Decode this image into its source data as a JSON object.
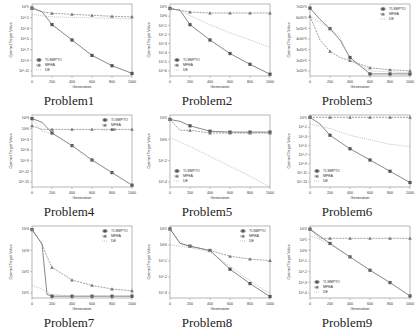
{
  "figure": {
    "series_names": [
      "TLSMPTO",
      "MFEA",
      "DE"
    ],
    "colors": {
      "TLSMPTO": "#555555",
      "MFEA": "#777777",
      "DE": "#aaaaaa",
      "axis": "#888888",
      "text": "#333333"
    },
    "xlabel": "Generation",
    "ylabel": "Optimal Target Value"
  },
  "chart_data": [
    {
      "type": "line",
      "title": "Problem1",
      "yscale": "log",
      "xlabel": "Generation",
      "ylabel": "Optimal Target Value",
      "x_ticks": [
        0,
        200,
        400,
        600,
        800,
        1000
      ],
      "y_ticks": [
        "10^1",
        "10^-1",
        "10^-3",
        "10^-5",
        "10^-7",
        "10^-9",
        "10^-11"
      ],
      "ylim_exp": [
        -12,
        2
      ],
      "legend_position": "lower left",
      "x": [
        0,
        100,
        200,
        400,
        600,
        800,
        1000
      ],
      "series": [
        {
          "name": "TLSMPTO",
          "values_exp": [
            1.2,
            0.5,
            -2,
            -5,
            -8,
            -10,
            -11.5
          ]
        },
        {
          "name": "MFEA",
          "values_exp": [
            1.2,
            0.5,
            0.2,
            0,
            -0.2,
            -0.4,
            -0.5
          ]
        },
        {
          "name": "DE",
          "values_exp": [
            0,
            -0.3,
            -0.5,
            -0.6,
            -0.7,
            -0.8,
            -0.9
          ]
        }
      ]
    },
    {
      "type": "line",
      "title": "Problem2",
      "yscale": "log",
      "xlabel": "Generation",
      "ylabel": "Optimal Target Value",
      "x_ticks": [
        0,
        200,
        400,
        600,
        800,
        1000
      ],
      "y_ticks": [
        "10^1",
        "10^0",
        "10^-1",
        "10^-2",
        "10^-3",
        "10^-4",
        "10^-5",
        "10^-6"
      ],
      "ylim_exp": [
        -6.5,
        1.5
      ],
      "legend_position": "lower left",
      "x": [
        0,
        100,
        200,
        400,
        600,
        800,
        1000
      ],
      "series": [
        {
          "name": "TLSMPTO",
          "values_exp": [
            1,
            0.8,
            -0.8,
            -2.5,
            -4,
            -5.2,
            -6.3
          ]
        },
        {
          "name": "MFEA",
          "values_exp": [
            1,
            0.8,
            0.6,
            0.5,
            0.5,
            0.5,
            0.5
          ]
        },
        {
          "name": "DE",
          "values_exp": [
            1,
            0.8,
            0.2,
            -0.8,
            -1.7,
            -2.5,
            -3.3
          ]
        }
      ]
    },
    {
      "type": "line",
      "title": "Problem3",
      "yscale": "log",
      "xlabel": "Generation",
      "ylabel": "Optimal Target Value",
      "x_ticks": [
        0,
        200,
        400,
        600,
        800,
        1000
      ],
      "y_ticks": [
        "7x10^1",
        "6x10^1",
        "5x10^1",
        "4x10^1",
        "3x10^1",
        "2x10^1",
        "1x10^1"
      ],
      "ylim_exp": [
        0,
        7
      ],
      "legend_position": "upper right",
      "x": [
        0,
        100,
        200,
        300,
        400,
        600,
        800,
        1000
      ],
      "series": [
        {
          "name": "TLSMPTO",
          "values_exp": [
            6.6,
            5.5,
            4.6,
            3.5,
            1.8,
            0.2,
            0.2,
            0.2
          ]
        },
        {
          "name": "MFEA",
          "values_exp": [
            5.8,
            3.5,
            2.4,
            1.8,
            1.5,
            0.8,
            0.6,
            0.5
          ]
        },
        {
          "name": "DE",
          "values_exp": [
            5.8,
            5.2,
            4.6,
            3.8,
            1.5,
            0.5,
            0.4,
            0.3
          ]
        }
      ]
    },
    {
      "type": "line",
      "title": "Problem4",
      "yscale": "log",
      "xlabel": "Generation",
      "ylabel": "Optimal Target Value",
      "x_ticks": [
        0,
        200,
        400,
        600,
        800,
        1000
      ],
      "y_ticks": [
        "10^3",
        "10^0",
        "10^-3",
        "10^-6",
        "10^-9",
        "10^-12",
        "10^-15"
      ],
      "ylim_exp": [
        -16,
        4
      ],
      "legend_position": "upper right",
      "x": [
        0,
        100,
        200,
        400,
        600,
        800,
        1000
      ],
      "series": [
        {
          "name": "TLSMPTO",
          "values_exp": [
            3,
            2,
            -1,
            -4.5,
            -8.5,
            -12,
            -15.5
          ]
        },
        {
          "name": "MFEA",
          "values_exp": [
            1,
            0,
            0,
            0,
            0,
            0,
            0
          ]
        },
        {
          "name": "DE",
          "values_exp": [
            3,
            -0.5,
            -1.2,
            -4.5,
            -8.5,
            -12,
            -15.5
          ]
        }
      ]
    },
    {
      "type": "line",
      "title": "Problem5",
      "yscale": "log",
      "xlabel": "Generation",
      "ylabel": "Optimal Target Value",
      "x_ticks": [
        0,
        200,
        400,
        600,
        800,
        1000
      ],
      "y_ticks": [
        "10^2",
        "10^0",
        "10^-2",
        "10^-4"
      ],
      "ylim_exp": [
        -5,
        3
      ],
      "legend_position": "lower left",
      "x": [
        0,
        100,
        200,
        400,
        600,
        800,
        1000
      ],
      "series": [
        {
          "name": "TLSMPTO",
          "values_exp": [
            2.5,
            2.3,
            1.8,
            1.2,
            1.1,
            1.1,
            1.1
          ]
        },
        {
          "name": "MFEA",
          "values_exp": [
            2.5,
            1.3,
            1.3,
            1.0,
            1.0,
            1.0,
            1.0
          ]
        },
        {
          "name": "DE",
          "values_exp": [
            0.5,
            0,
            -0.5,
            -1.6,
            -2.7,
            -3.8,
            -5
          ]
        }
      ]
    },
    {
      "type": "line",
      "title": "Problem6",
      "yscale": "log",
      "xlabel": "Generation",
      "ylabel": "Optimal Target Value",
      "x_ticks": [
        0,
        200,
        400,
        600,
        800,
        1000
      ],
      "y_ticks": [
        "10^1",
        "10^-1",
        "10^-3",
        "10^-5",
        "10^-7",
        "10^-9",
        "10^-11",
        "10^-13"
      ],
      "ylim_exp": [
        -14,
        2
      ],
      "legend_position": "lower left",
      "x": [
        0,
        100,
        200,
        400,
        600,
        800,
        1000
      ],
      "series": [
        {
          "name": "TLSMPTO",
          "values_exp": [
            1.5,
            0,
            -2.5,
            -5.5,
            -8,
            -10.5,
            -13
          ]
        },
        {
          "name": "MFEA",
          "values_exp": [
            1.5,
            1.5,
            1.5,
            1.5,
            1.5,
            1.5,
            1.5
          ]
        },
        {
          "name": "DE",
          "values_exp": [
            0,
            -0.5,
            -1,
            -2.5,
            -3.5,
            -4.5,
            -5
          ]
        }
      ]
    },
    {
      "type": "line",
      "title": "Problem7",
      "yscale": "log",
      "xlabel": "Generation",
      "ylabel": "Optimal Target Value",
      "x_ticks": [
        0,
        200,
        400,
        600,
        800,
        1000
      ],
      "y_ticks": [
        "10^4",
        "10^3",
        "10^2",
        "10^1"
      ],
      "ylim_exp": [
        0.5,
        4.5
      ],
      "legend_position": "upper right",
      "x": [
        0,
        100,
        150,
        200,
        400,
        600,
        800,
        1000
      ],
      "series": [
        {
          "name": "TLSMPTO",
          "values_exp": [
            4.3,
            3.5,
            0.7,
            0.6,
            0.6,
            0.6,
            0.6,
            0.6
          ]
        },
        {
          "name": "MFEA",
          "values_exp": [
            4.3,
            3.5,
            2.8,
            2.2,
            1.5,
            1.2,
            1.0,
            0.9
          ]
        },
        {
          "name": "DE",
          "values_exp": [
            1.2,
            1.0,
            0.8,
            0.7,
            0.6,
            0.6,
            0.6,
            0.6
          ]
        }
      ]
    },
    {
      "type": "line",
      "title": "Problem8",
      "yscale": "log",
      "xlabel": "Generation",
      "ylabel": "Optimal Target Value",
      "x_ticks": [
        0,
        200,
        400,
        600,
        800,
        1000
      ],
      "y_ticks": [
        "10^1",
        "10^0",
        "10^-1",
        "10^-2",
        "10^-3"
      ],
      "ylim_exp": [
        -3.5,
        1.5
      ],
      "legend_position": "upper right",
      "x": [
        0,
        100,
        200,
        400,
        600,
        800,
        1000
      ],
      "series": [
        {
          "name": "TLSMPTO",
          "values_exp": [
            1.3,
            0.3,
            0.1,
            -0.2,
            -1.5,
            -2.5,
            -3.4
          ]
        },
        {
          "name": "MFEA",
          "values_exp": [
            1.3,
            0.3,
            0.1,
            -0.2,
            -0.6,
            -0.8,
            -0.9
          ]
        },
        {
          "name": "DE",
          "values_exp": [
            0.2,
            0.1,
            0,
            -0.3,
            -1.3,
            -2.3,
            -3.2
          ]
        }
      ]
    },
    {
      "type": "line",
      "title": "Problem9",
      "yscale": "log",
      "xlabel": "Generation",
      "ylabel": "Optimal Target Value",
      "x_ticks": [
        0,
        200,
        400,
        600,
        800,
        1000
      ],
      "y_ticks": [
        "10^2",
        "10^1",
        "10^0",
        "10^-1",
        "10^-2",
        "10^-3",
        "10^-4"
      ],
      "ylim_exp": [
        -4.5,
        2.5
      ],
      "legend_position": "lower left",
      "x": [
        0,
        100,
        200,
        400,
        600,
        800,
        1000
      ],
      "series": [
        {
          "name": "TLSMPTO",
          "values_exp": [
            2.2,
            1.5,
            0.8,
            -0.5,
            -1.8,
            -3.0,
            -4.3
          ]
        },
        {
          "name": "MFEA",
          "values_exp": [
            2.2,
            1.3,
            1.3,
            1.3,
            1.3,
            1.3,
            1.3
          ]
        },
        {
          "name": "DE",
          "values_exp": [
            1.5,
            1.2,
            0.7,
            -0.5,
            -1.8,
            -3.0,
            -4.3
          ]
        }
      ]
    }
  ]
}
